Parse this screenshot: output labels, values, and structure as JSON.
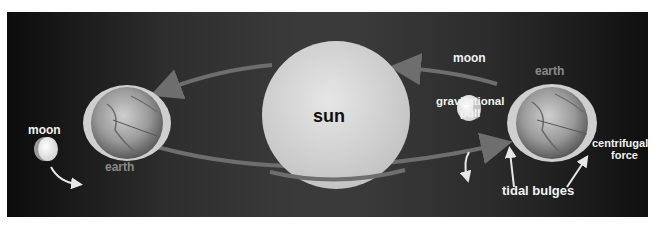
{
  "diagram": {
    "labels": {
      "sun": "sun",
      "moon_left": "moon",
      "earth_left": "earth",
      "moon_right": "moon",
      "earth_right": "earth",
      "gravitational_pull_line1": "gravitational",
      "gravitational_pull_line2": "pull",
      "centrifugal_force_line1": "centrifugal",
      "centrifugal_force_line2": "force",
      "tidal_bulges": "tidal bulges"
    },
    "colors": {
      "background_dark": "#0c0c0c",
      "background_mid": "#3a3a3a",
      "sun_fill": "#d9d9d9",
      "orbit_arrow": "#6e6e6e",
      "label_white": "#f2f2f2",
      "label_grey": "#8a8a8a",
      "bulge": "#cfcfcf"
    }
  }
}
